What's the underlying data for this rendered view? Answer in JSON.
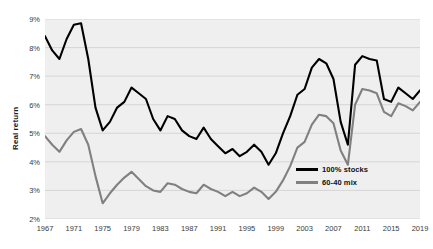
{
  "chart_data": {
    "type": "line",
    "title": "",
    "xlabel": "",
    "ylabel": "Real return",
    "xlim": [
      1967,
      2019
    ],
    "ylim": [
      2,
      9
    ],
    "ytick_labels": [
      "9%",
      "8%",
      "7%",
      "6%",
      "5%",
      "4%",
      "3%",
      "2%"
    ],
    "ytick_values": [
      9,
      8,
      7,
      6,
      5,
      4,
      3,
      2
    ],
    "xtick_labels": [
      "1967",
      "1971",
      "1975",
      "1979",
      "1983",
      "1987",
      "1991",
      "1995",
      "1999",
      "2003",
      "2007",
      "2011",
      "2015",
      "2019"
    ],
    "xtick_values": [
      1967,
      1971,
      1975,
      1979,
      1983,
      1987,
      1991,
      1995,
      1999,
      2003,
      2007,
      2011,
      2015,
      2019
    ],
    "grid": true,
    "legend_position": "inside-bottom-right",
    "x": [
      1967,
      1968,
      1969,
      1970,
      1971,
      1972,
      1973,
      1974,
      1975,
      1976,
      1977,
      1978,
      1979,
      1980,
      1981,
      1982,
      1983,
      1984,
      1985,
      1986,
      1987,
      1988,
      1989,
      1990,
      1991,
      1992,
      1993,
      1994,
      1995,
      1996,
      1997,
      1998,
      1999,
      2000,
      2001,
      2002,
      2003,
      2004,
      2005,
      2006,
      2007,
      2008,
      2009,
      2010,
      2011,
      2012,
      2013,
      2014,
      2015,
      2016,
      2017,
      2018,
      2019
    ],
    "series": [
      {
        "name": "100% stocks",
        "color": "#000000",
        "values": [
          8.4,
          7.9,
          7.6,
          8.3,
          8.8,
          8.85,
          7.6,
          5.9,
          5.1,
          5.4,
          5.9,
          6.1,
          6.6,
          6.4,
          6.2,
          5.5,
          5.1,
          5.6,
          5.5,
          5.1,
          4.9,
          4.8,
          5.2,
          4.8,
          4.55,
          4.3,
          4.45,
          4.2,
          4.35,
          4.6,
          4.35,
          3.9,
          4.3,
          5.0,
          5.6,
          6.35,
          6.55,
          7.3,
          7.6,
          7.45,
          6.9,
          5.4,
          4.6,
          7.4,
          7.7,
          7.6,
          7.55,
          6.2,
          6.1,
          6.6,
          6.4,
          6.2,
          6.5
        ],
        "endpoint_note": ""
      },
      {
        "name": "60-40 mix",
        "color": "#808080",
        "values": [
          4.9,
          4.6,
          4.35,
          4.75,
          5.05,
          5.15,
          4.6,
          3.5,
          2.55,
          2.9,
          3.2,
          3.45,
          3.65,
          3.4,
          3.15,
          3.0,
          2.95,
          3.25,
          3.2,
          3.05,
          2.95,
          2.9,
          3.2,
          3.05,
          2.95,
          2.8,
          2.95,
          2.8,
          2.9,
          3.1,
          2.95,
          2.7,
          2.95,
          3.35,
          3.85,
          4.5,
          4.7,
          5.3,
          5.65,
          5.6,
          5.35,
          4.4,
          3.9,
          6.0,
          6.55,
          6.5,
          6.4,
          5.75,
          5.6,
          6.05,
          5.95,
          5.8,
          6.1
        ],
        "endpoint_note": ""
      }
    ]
  },
  "legend": {
    "items": [
      {
        "label": "100% stocks",
        "color": "#000000"
      },
      {
        "label": "60-40 mix",
        "color": "#808080"
      }
    ]
  }
}
